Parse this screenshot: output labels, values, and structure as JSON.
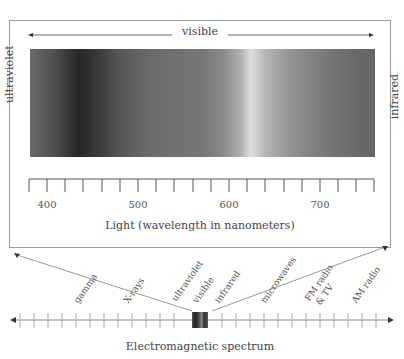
{
  "figure": {
    "visible_label": "visible",
    "left_side_label": "ultraviolet",
    "right_side_label": "infrared",
    "axis_title": "Light (wavelength in nanometers)",
    "tick_labels": [
      "400",
      "500",
      "600",
      "700"
    ],
    "tick_range_nm": [
      380,
      760
    ],
    "em_spectrum_title": "Electromagnetic spectrum",
    "em_bands": [
      "gamma",
      "X-rays",
      "ultraviolet",
      "visible",
      "infrared",
      "microwaves",
      "FM radio & TV",
      "AM radio"
    ],
    "em_band_fm_lines": [
      "FM radio",
      "& TV"
    ]
  },
  "colors": {
    "frame": "#9a9a9a",
    "text": "#444444",
    "line": "#888888"
  }
}
